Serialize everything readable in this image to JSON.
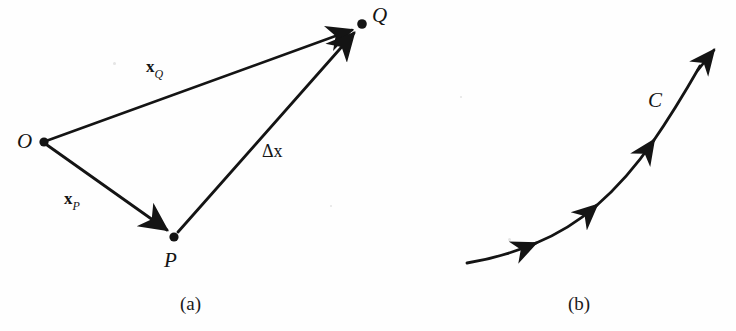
{
  "figure": {
    "background_color": "#fefefe",
    "ink_color": "#141414",
    "panels": [
      {
        "id": "a",
        "caption": "(a)",
        "type": "vector-triangle",
        "points": [
          {
            "name": "origin",
            "label": "O",
            "x": 44,
            "y": 142
          },
          {
            "name": "point-p",
            "label": "P",
            "x": 174,
            "y": 237
          },
          {
            "name": "point-q",
            "label": "Q",
            "x": 362,
            "y": 24
          }
        ],
        "point_label_positions": [
          {
            "name": "origin",
            "label": "O",
            "x": 17,
            "y": 131
          },
          {
            "name": "point-p",
            "label": "P",
            "x": 164,
            "y": 250
          },
          {
            "name": "point-q",
            "label": "Q",
            "x": 372,
            "y": 5
          }
        ],
        "vectors": [
          {
            "name": "x-q",
            "symbol": "x",
            "subscript": "Q",
            "from": "origin",
            "to": "point-q",
            "label_x": 146,
            "label_y": 58
          },
          {
            "name": "x-p",
            "symbol": "x",
            "subscript": "P",
            "from": "origin",
            "to": "point-p",
            "label_x": 64,
            "label_y": 190
          },
          {
            "name": "delta-x",
            "symbol": "Δx",
            "subscript": "",
            "from": "point-p",
            "to": "point-q",
            "label_x": 262,
            "label_y": 142
          }
        ]
      },
      {
        "id": "b",
        "caption": "(b)",
        "type": "oriented-curve",
        "curve_label": "C",
        "curve_label_x": 648,
        "curve_label_y": 90,
        "curve_start": {
          "x": 467,
          "y": 263
        },
        "curve_end": {
          "x": 719,
          "y": 44
        },
        "arrow_count": 4
      }
    ],
    "captions": [
      {
        "name": "caption-a",
        "text": "(a)",
        "x": 180,
        "y": 294
      },
      {
        "name": "caption-b",
        "text": "(b)",
        "x": 568,
        "y": 294
      }
    ]
  }
}
